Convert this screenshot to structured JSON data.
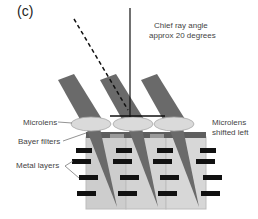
{
  "figure": {
    "panel_label": "(c)",
    "annotations": {
      "chief_ray_line1": "Chief ray angle",
      "chief_ray_line2": "approx 20 degrees",
      "microlens": "Microlens",
      "bayer_filters": "Bayer filters",
      "metal_layers": "Metal layers",
      "microlens_shifted_line1": "Microlens",
      "microlens_shifted_line2": "shifted left"
    },
    "colors": {
      "ray": "#6b6b6b",
      "microlens": "#d9d9d9",
      "bayer": "#5a5a5a",
      "substrate": "#cfcfcf",
      "metal": "#111111"
    },
    "pixel_count": 3
  }
}
